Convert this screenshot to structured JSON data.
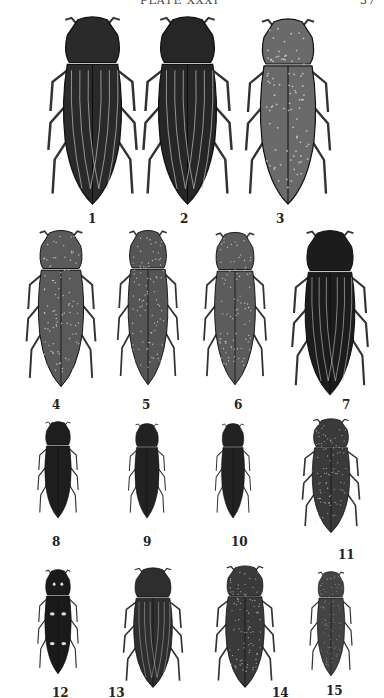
{
  "header": {
    "title": "PLATE XXXI",
    "page": "37"
  },
  "figures": [
    {
      "n": "1",
      "x": 40,
      "y": 14,
      "w": 105,
      "h": 194,
      "shade": "#2a2a2a",
      "pattern": "stripes",
      "lx": 88,
      "ly": 212
    },
    {
      "n": "2",
      "x": 135,
      "y": 14,
      "w": 105,
      "h": 194,
      "shade": "#262626",
      "pattern": "stripes",
      "lx": 180,
      "ly": 212
    },
    {
      "n": "3",
      "x": 238,
      "y": 16,
      "w": 100,
      "h": 192,
      "shade": "#6a6a6a",
      "pattern": "speckle",
      "lx": 276,
      "ly": 212
    },
    {
      "n": "4",
      "x": 20,
      "y": 228,
      "w": 82,
      "h": 162,
      "shade": "#5a5a5a",
      "pattern": "speckle",
      "lx": 52,
      "ly": 398
    },
    {
      "n": "5",
      "x": 112,
      "y": 228,
      "w": 72,
      "h": 160,
      "shade": "#555",
      "pattern": "speckle",
      "lx": 142,
      "ly": 398
    },
    {
      "n": "6",
      "x": 198,
      "y": 230,
      "w": 74,
      "h": 158,
      "shade": "#5c5c5c",
      "pattern": "speckle",
      "lx": 234,
      "ly": 398
    },
    {
      "n": "7",
      "x": 285,
      "y": 228,
      "w": 90,
      "h": 170,
      "shade": "#1c1c1c",
      "pattern": "stripes",
      "lx": 342,
      "ly": 398
    },
    {
      "n": "8",
      "x": 34,
      "y": 420,
      "w": 48,
      "h": 100,
      "shade": "#1e1e1e",
      "pattern": "solid",
      "lx": 52,
      "ly": 535
    },
    {
      "n": "9",
      "x": 125,
      "y": 422,
      "w": 44,
      "h": 98,
      "shade": "#222",
      "pattern": "solid",
      "lx": 143,
      "ly": 535
    },
    {
      "n": "10",
      "x": 212,
      "y": 422,
      "w": 42,
      "h": 98,
      "shade": "#222",
      "pattern": "solid",
      "lx": 231,
      "ly": 535
    },
    {
      "n": "11",
      "x": 297,
      "y": 417,
      "w": 68,
      "h": 118,
      "shade": "#3a3a3a",
      "pattern": "speckle",
      "lx": 338,
      "ly": 548
    },
    {
      "n": "12",
      "x": 34,
      "y": 568,
      "w": 48,
      "h": 108,
      "shade": "#1a1a1a",
      "pattern": "spots",
      "lx": 52,
      "ly": 686
    },
    {
      "n": "13",
      "x": 118,
      "y": 566,
      "w": 70,
      "h": 124,
      "shade": "#2e2e2e",
      "pattern": "stripes",
      "lx": 108,
      "ly": 686
    },
    {
      "n": "14",
      "x": 210,
      "y": 564,
      "w": 70,
      "h": 126,
      "shade": "#3a3a3a",
      "pattern": "speckle",
      "lx": 272,
      "ly": 686
    },
    {
      "n": "15",
      "x": 306,
      "y": 570,
      "w": 50,
      "h": 108,
      "shade": "#444",
      "pattern": "speckle",
      "lx": 326,
      "ly": 684
    }
  ]
}
